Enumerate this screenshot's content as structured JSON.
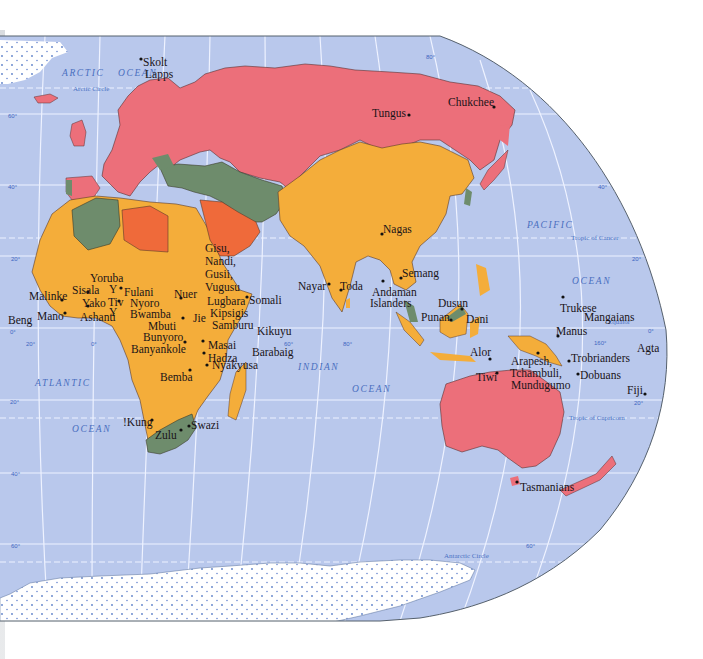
{
  "map": {
    "colors": {
      "ocean": "#b9c8ec",
      "grid": "#eef2ff",
      "red": "#ec6f7a",
      "orange": "#f4ad3a",
      "red_orange": "#ef6a3a",
      "green": "#6e8c6c",
      "ice": "#ffffff",
      "border": "#4a3a2a"
    },
    "oceans": [
      {
        "id": "arctic-1",
        "label": "ARCTIC",
        "x": 62,
        "y": 68
      },
      {
        "id": "arctic-2",
        "label": "OCEAN",
        "x": 118,
        "y": 68
      },
      {
        "id": "atlantic-1",
        "label": "ATLANTIC",
        "x": 35,
        "y": 378
      },
      {
        "id": "atlantic-2",
        "label": "OCEAN",
        "x": 72,
        "y": 424
      },
      {
        "id": "indian-1",
        "label": "INDIAN",
        "x": 298,
        "y": 362
      },
      {
        "id": "indian-2",
        "label": "OCEAN",
        "x": 352,
        "y": 384
      },
      {
        "id": "pacific-1",
        "label": "PACIFIC",
        "x": 527,
        "y": 220
      },
      {
        "id": "pacific-2",
        "label": "OCEAN",
        "x": 572,
        "y": 276
      }
    ],
    "lines": [
      {
        "id": "arctic-circle",
        "label": "Arctic Circle",
        "x": 73,
        "y": 88
      },
      {
        "id": "tropic-cancer",
        "label": "Tropic of Cancer",
        "x": 571,
        "y": 237
      },
      {
        "id": "equator",
        "label": "Equator",
        "x": 608,
        "y": 321
      },
      {
        "id": "tropic-capricorn",
        "label": "Tropic of Capricorn",
        "x": 569,
        "y": 417
      },
      {
        "id": "antarctic-circle",
        "label": "Antarctic Circle",
        "x": 444,
        "y": 552
      }
    ],
    "degrees": [
      {
        "label": "60°",
        "x": 8,
        "y": 113
      },
      {
        "label": "40°",
        "x": 8,
        "y": 184
      },
      {
        "label": "20°",
        "x": 11,
        "y": 256
      },
      {
        "label": "0°",
        "x": 10,
        "y": 329
      },
      {
        "label": "20°",
        "x": 26,
        "y": 341
      },
      {
        "label": "0°",
        "x": 91,
        "y": 341
      },
      {
        "label": "20°",
        "x": 10,
        "y": 399
      },
      {
        "label": "40°",
        "x": 11,
        "y": 471
      },
      {
        "label": "60°",
        "x": 11,
        "y": 543
      },
      {
        "label": "60°",
        "x": 284,
        "y": 341
      },
      {
        "label": "80°",
        "x": 343,
        "y": 341
      },
      {
        "label": "80°",
        "x": 426,
        "y": 54
      },
      {
        "label": "40°",
        "x": 598,
        "y": 184
      },
      {
        "label": "20°",
        "x": 632,
        "y": 256
      },
      {
        "label": "0°",
        "x": 648,
        "y": 328
      },
      {
        "label": "160°",
        "x": 594,
        "y": 340
      },
      {
        "label": "20°",
        "x": 634,
        "y": 400
      },
      {
        "label": "60°",
        "x": 526,
        "y": 543
      }
    ],
    "peoples": [
      {
        "name": "Skolt",
        "x": 143,
        "y": 56,
        "dot": [
          141,
          59
        ]
      },
      {
        "name": "Lapps",
        "x": 145,
        "y": 68
      },
      {
        "name": "Tungus",
        "x": 372,
        "y": 107,
        "dot": [
          409,
          115
        ]
      },
      {
        "name": "Chukchee",
        "x": 448,
        "y": 96,
        "dot": [
          494,
          107
        ]
      },
      {
        "name": "Gisu,",
        "x": 205,
        "y": 242
      },
      {
        "name": "Nandi,",
        "x": 205,
        "y": 255
      },
      {
        "name": "Gusii,",
        "x": 205,
        "y": 268
      },
      {
        "name": "Vugusu",
        "x": 205,
        "y": 281
      },
      {
        "name": "Nagas",
        "x": 383,
        "y": 223,
        "dot": [
          382,
          234
        ]
      },
      {
        "name": "Semang",
        "x": 402,
        "y": 267,
        "dot": [
          401,
          278
        ]
      },
      {
        "name": "Yoruba",
        "x": 90,
        "y": 272
      },
      {
        "name": "Y",
        "x": 109,
        "y": 283
      },
      {
        "name": "Sisala",
        "x": 72,
        "y": 284,
        "dot": [
          88,
          292
        ]
      },
      {
        "name": "Fulani",
        "x": 124,
        "y": 286,
        "dot": [
          121,
          288
        ]
      },
      {
        "name": "Malinke",
        "x": 29,
        "y": 290,
        "dot": [
          62,
          300
        ]
      },
      {
        "name": "Nyoro",
        "x": 130,
        "y": 297
      },
      {
        "name": "Yako",
        "x": 82,
        "y": 297,
        "dot": [
          88,
          306
        ]
      },
      {
        "name": "Tiv",
        "x": 108,
        "y": 296,
        "dot": [
          119,
          301
        ]
      },
      {
        "name": "Y",
        "x": 109,
        "y": 306
      },
      {
        "name": "Nuer",
        "x": 174,
        "y": 288,
        "dot": [
          181,
          298
        ]
      },
      {
        "name": "Lugbara",
        "x": 207,
        "y": 295
      },
      {
        "name": "Somali",
        "x": 249,
        "y": 294,
        "dot": [
          247,
          297
        ]
      },
      {
        "name": "Kipsigis",
        "x": 210,
        "y": 307
      },
      {
        "name": "Bwamba",
        "x": 130,
        "y": 308
      },
      {
        "name": "Jie",
        "x": 193,
        "y": 312
      },
      {
        "name": "Mbuti",
        "x": 148,
        "y": 320,
        "dot": [
          183,
          318
        ]
      },
      {
        "name": "Samburu",
        "x": 212,
        "y": 319
      },
      {
        "name": "Beng",
        "x": 8,
        "y": 314
      },
      {
        "name": "Mano",
        "x": 37,
        "y": 310,
        "dot": [
          65,
          313
        ]
      },
      {
        "name": "Ashanti",
        "x": 80,
        "y": 311
      },
      {
        "name": "Bunyoro",
        "x": 143,
        "y": 331
      },
      {
        "name": "Kikuyu",
        "x": 257,
        "y": 325
      },
      {
        "name": "Banyankole",
        "x": 131,
        "y": 343,
        "dot": [
          185,
          342
        ]
      },
      {
        "name": "Masai",
        "x": 208,
        "y": 339,
        "dot": [
          203,
          341
        ]
      },
      {
        "name": "Barabaig",
        "x": 252,
        "y": 346
      },
      {
        "name": "Hadza",
        "x": 208,
        "y": 352,
        "dot": [
          204,
          353
        ]
      },
      {
        "name": "Nyakyusa",
        "x": 212,
        "y": 359,
        "dot": [
          207,
          365
        ]
      },
      {
        "name": "Bemba",
        "x": 160,
        "y": 371,
        "dot": [
          190,
          370
        ]
      },
      {
        "name": "!Kung",
        "x": 123,
        "y": 416,
        "dot": [
          152,
          420
        ]
      },
      {
        "name": "Swazi",
        "x": 191,
        "y": 419,
        "dot": [
          189,
          426
        ]
      },
      {
        "name": "Zulu",
        "x": 155,
        "y": 429,
        "dot": [
          181,
          430
        ]
      },
      {
        "name": "Nayar",
        "x": 298,
        "y": 280,
        "dot": [
          329,
          284
        ]
      },
      {
        "name": "Toda",
        "x": 340,
        "y": 280,
        "dot": [
          341,
          290
        ]
      },
      {
        "name": "Andaman",
        "x": 372,
        "y": 286,
        "dot": [
          383,
          281
        ]
      },
      {
        "name": "Islanders",
        "x": 370,
        "y": 297
      },
      {
        "name": "Dusun",
        "x": 438,
        "y": 297,
        "dot": [
          462,
          309
        ]
      },
      {
        "name": "Punan",
        "x": 421,
        "y": 311,
        "dot": [
          451,
          320
        ]
      },
      {
        "name": "Dani",
        "x": 466,
        "y": 313
      },
      {
        "name": "Trukese",
        "x": 560,
        "y": 302,
        "dot": [
          563,
          297
        ]
      },
      {
        "name": "Mangaians",
        "x": 584,
        "y": 311
      },
      {
        "name": "Manus",
        "x": 556,
        "y": 325,
        "dot": [
          558,
          336
        ]
      },
      {
        "name": "Agta",
        "x": 637,
        "y": 342
      },
      {
        "name": "Alor",
        "x": 470,
        "y": 346,
        "dot": [
          490,
          359
        ]
      },
      {
        "name": "Arapesh,",
        "x": 511,
        "y": 355,
        "dot": [
          538,
          353
        ]
      },
      {
        "name": "Trobrianders",
        "x": 571,
        "y": 352,
        "dot": [
          569,
          361
        ]
      },
      {
        "name": "Tchambuli,",
        "x": 510,
        "y": 367
      },
      {
        "name": "Tiwi",
        "x": 476,
        "y": 371,
        "dot": [
          497,
          373
        ]
      },
      {
        "name": "Dobuans",
        "x": 580,
        "y": 369,
        "dot": [
          578,
          374
        ]
      },
      {
        "name": "Mundugumo",
        "x": 511,
        "y": 379
      },
      {
        "name": "Fiji",
        "x": 627,
        "y": 384,
        "dot": [
          645,
          394
        ]
      },
      {
        "name": "Tasmanians",
        "x": 520,
        "y": 481,
        "dot": [
          517,
          482
        ]
      }
    ]
  }
}
